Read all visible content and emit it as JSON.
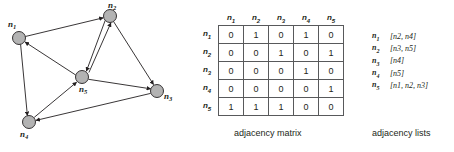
{
  "graph": {
    "nodes": [
      {
        "id": "n1",
        "label": "n",
        "sub": "1",
        "cx": 19,
        "cy": 38,
        "r": 6.5,
        "label_x": 8,
        "label_y": 27
      },
      {
        "id": "n2",
        "label": "n",
        "sub": "2",
        "cx": 110,
        "cy": 16,
        "r": 6.5,
        "label_x": 108,
        "label_y": 8
      },
      {
        "id": "n3",
        "label": "n",
        "sub": "3",
        "cx": 157,
        "cy": 91,
        "r": 6.5,
        "label_x": 164,
        "label_y": 99
      },
      {
        "id": "n4",
        "label": "n",
        "sub": "4",
        "cx": 29,
        "cy": 122,
        "r": 6.5,
        "label_x": 20,
        "label_y": 137
      },
      {
        "id": "n5",
        "label": "n",
        "sub": "5",
        "cx": 82,
        "cy": 77,
        "r": 6.5,
        "label_x": 79,
        "label_y": 92
      }
    ],
    "edges": [
      {
        "from": "n1",
        "to": "n2"
      },
      {
        "from": "n1",
        "to": "n4"
      },
      {
        "from": "n2",
        "to": "n3"
      },
      {
        "from": "n2",
        "to": "n5"
      },
      {
        "from": "n3",
        "to": "n4"
      },
      {
        "from": "n4",
        "to": "n5"
      },
      {
        "from": "n5",
        "to": "n1"
      },
      {
        "from": "n5",
        "to": "n2"
      },
      {
        "from": "n5",
        "to": "n3"
      }
    ],
    "node_fill": "#b3b3b3",
    "node_stroke": "#231f20",
    "edge_color": "#231f20"
  },
  "matrix": {
    "column_headers": [
      "n1",
      "n2",
      "n3",
      "n4",
      "n5"
    ],
    "row_headers": [
      "n1",
      "n2",
      "n3",
      "n4",
      "n5"
    ],
    "header_labels": [
      {
        "base": "n",
        "sub": "1"
      },
      {
        "base": "n",
        "sub": "2"
      },
      {
        "base": "n",
        "sub": "3"
      },
      {
        "base": "n",
        "sub": "4"
      },
      {
        "base": "n",
        "sub": "5"
      }
    ],
    "rows": [
      [
        0,
        1,
        0,
        1,
        0
      ],
      [
        0,
        0,
        1,
        0,
        1
      ],
      [
        0,
        0,
        0,
        1,
        0
      ],
      [
        0,
        0,
        0,
        0,
        1
      ],
      [
        1,
        1,
        1,
        0,
        0
      ]
    ],
    "caption": "adjacency matrix"
  },
  "lists": {
    "entries": [
      {
        "key_base": "n",
        "key_sub": "1",
        "value": "[n2, n4]",
        "targets": [
          {
            "base": "n",
            "sub": "2"
          },
          {
            "base": "n",
            "sub": "4"
          }
        ]
      },
      {
        "key_base": "n",
        "key_sub": "2",
        "value": "[n3, n5]",
        "targets": [
          {
            "base": "n",
            "sub": "3"
          },
          {
            "base": "n",
            "sub": "5"
          }
        ]
      },
      {
        "key_base": "n",
        "key_sub": "3",
        "value": "[n4]",
        "targets": [
          {
            "base": "n",
            "sub": "4"
          }
        ]
      },
      {
        "key_base": "n",
        "key_sub": "4",
        "value": "[n5]",
        "targets": [
          {
            "base": "n",
            "sub": "5"
          }
        ]
      },
      {
        "key_base": "n",
        "key_sub": "5",
        "value": "[n1, n2, n3]",
        "targets": [
          {
            "base": "n",
            "sub": "1"
          },
          {
            "base": "n",
            "sub": "2"
          },
          {
            "base": "n",
            "sub": "3"
          }
        ]
      }
    ],
    "caption": "adjacency lists"
  }
}
